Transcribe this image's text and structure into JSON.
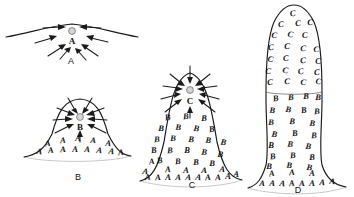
{
  "figure": {
    "background_color": "#ffffff",
    "ink_color": "#1a1a1a",
    "core_dot_color": "#d6d6d6"
  },
  "panels": [
    {
      "id": "A",
      "label": "A",
      "label_x": 71,
      "label_y": 62,
      "description": "Nearly flat surface with a small nucleating core",
      "core": {
        "letter": "A",
        "x": 72,
        "y": 41,
        "dot_x": 72,
        "dot_y": 31
      },
      "zones": [],
      "arrow_count": 8
    },
    {
      "id": "B",
      "label": "B",
      "label_x": 78,
      "label_y": 178,
      "description": "Low mound; base populated by A, core growing as B",
      "core": {
        "letter": "B",
        "x": 80,
        "y": 126,
        "dot_x": 80,
        "dot_y": 117
      },
      "zones": [
        {
          "letter": "A",
          "rows": 2
        }
      ],
      "arrow_count": 8
    },
    {
      "id": "C",
      "label": "C",
      "label_x": 192,
      "label_y": 186,
      "description": "Tall mound; A at base, B mantle, core growing as C",
      "core": {
        "letter": "C",
        "x": 190,
        "y": 101,
        "dot_x": 190,
        "dot_y": 90
      },
      "zones": [
        {
          "letter": "A",
          "rows": 2
        },
        {
          "letter": "B",
          "rows": 5
        }
      ],
      "arrow_count": 9
    },
    {
      "id": "D",
      "label": "D",
      "label_x": 298,
      "label_y": 191,
      "description": "Mature column; A base, B shaft, C cap zone fully formed",
      "core": null,
      "zones": [
        {
          "letter": "A",
          "rows": 2
        },
        {
          "letter": "B",
          "rows": 8
        },
        {
          "letter": "C",
          "rows": 8
        }
      ],
      "arrow_count": 0
    }
  ],
  "letters": {
    "panelB_A": [
      {
        "x": 48,
        "y": 146
      },
      {
        "x": 63,
        "y": 143
      },
      {
        "x": 78,
        "y": 141
      },
      {
        "x": 93,
        "y": 143
      },
      {
        "x": 108,
        "y": 146
      },
      {
        "x": 39,
        "y": 154
      },
      {
        "x": 51,
        "y": 153
      },
      {
        "x": 63,
        "y": 152
      },
      {
        "x": 75,
        "y": 152
      },
      {
        "x": 87,
        "y": 152
      },
      {
        "x": 99,
        "y": 153
      },
      {
        "x": 111,
        "y": 154
      },
      {
        "x": 121,
        "y": 155
      }
    ],
    "panelC_B": [
      {
        "x": 168,
        "y": 120
      },
      {
        "x": 186,
        "y": 119
      },
      {
        "x": 204,
        "y": 121
      },
      {
        "x": 161,
        "y": 131
      },
      {
        "x": 178,
        "y": 130
      },
      {
        "x": 196,
        "y": 131
      },
      {
        "x": 212,
        "y": 132
      },
      {
        "x": 157,
        "y": 142
      },
      {
        "x": 173,
        "y": 141
      },
      {
        "x": 191,
        "y": 142
      },
      {
        "x": 208,
        "y": 143
      },
      {
        "x": 223,
        "y": 145
      },
      {
        "x": 154,
        "y": 153
      },
      {
        "x": 170,
        "y": 153
      },
      {
        "x": 187,
        "y": 153
      },
      {
        "x": 204,
        "y": 155
      },
      {
        "x": 220,
        "y": 157
      },
      {
        "x": 160,
        "y": 163
      },
      {
        "x": 178,
        "y": 164
      },
      {
        "x": 196,
        "y": 165
      },
      {
        "x": 212,
        "y": 166
      }
    ],
    "panelC_A": [
      {
        "x": 152,
        "y": 164
      },
      {
        "x": 168,
        "y": 172
      },
      {
        "x": 186,
        "y": 173
      },
      {
        "x": 204,
        "y": 173
      },
      {
        "x": 222,
        "y": 172
      },
      {
        "x": 145,
        "y": 174
      },
      {
        "x": 148,
        "y": 180
      },
      {
        "x": 158,
        "y": 180
      },
      {
        "x": 168,
        "y": 180
      },
      {
        "x": 178,
        "y": 180
      },
      {
        "x": 188,
        "y": 180
      },
      {
        "x": 198,
        "y": 180
      },
      {
        "x": 208,
        "y": 180
      },
      {
        "x": 218,
        "y": 180
      },
      {
        "x": 228,
        "y": 179
      },
      {
        "x": 236,
        "y": 177
      }
    ],
    "panelD_C": [
      {
        "x": 293,
        "y": 16
      },
      {
        "x": 281,
        "y": 27
      },
      {
        "x": 298,
        "y": 26
      },
      {
        "x": 310,
        "y": 25
      },
      {
        "x": 274,
        "y": 38
      },
      {
        "x": 290,
        "y": 37
      },
      {
        "x": 305,
        "y": 38
      },
      {
        "x": 271,
        "y": 50
      },
      {
        "x": 287,
        "y": 49
      },
      {
        "x": 303,
        "y": 51
      },
      {
        "x": 316,
        "y": 52
      },
      {
        "x": 270,
        "y": 62
      },
      {
        "x": 286,
        "y": 61
      },
      {
        "x": 303,
        "y": 63
      },
      {
        "x": 318,
        "y": 64
      },
      {
        "x": 268,
        "y": 74
      },
      {
        "x": 285,
        "y": 73
      },
      {
        "x": 301,
        "y": 74
      },
      {
        "x": 317,
        "y": 75
      },
      {
        "x": 270,
        "y": 85
      },
      {
        "x": 287,
        "y": 84
      },
      {
        "x": 303,
        "y": 85
      },
      {
        "x": 318,
        "y": 84
      }
    ],
    "panelD_B": [
      {
        "x": 276,
        "y": 101
      },
      {
        "x": 291,
        "y": 100
      },
      {
        "x": 306,
        "y": 99
      },
      {
        "x": 318,
        "y": 100
      },
      {
        "x": 272,
        "y": 113
      },
      {
        "x": 288,
        "y": 112
      },
      {
        "x": 304,
        "y": 113
      },
      {
        "x": 317,
        "y": 114
      },
      {
        "x": 271,
        "y": 125
      },
      {
        "x": 292,
        "y": 124
      },
      {
        "x": 312,
        "y": 126
      },
      {
        "x": 274,
        "y": 137
      },
      {
        "x": 295,
        "y": 136
      },
      {
        "x": 314,
        "y": 138
      },
      {
        "x": 271,
        "y": 148
      },
      {
        "x": 290,
        "y": 147
      },
      {
        "x": 308,
        "y": 149
      },
      {
        "x": 273,
        "y": 159
      },
      {
        "x": 293,
        "y": 158
      },
      {
        "x": 312,
        "y": 160
      },
      {
        "x": 269,
        "y": 169
      },
      {
        "x": 289,
        "y": 168
      },
      {
        "x": 309,
        "y": 170
      }
    ],
    "panelD_A": [
      {
        "x": 272,
        "y": 176
      },
      {
        "x": 292,
        "y": 175
      },
      {
        "x": 312,
        "y": 176
      },
      {
        "x": 262,
        "y": 186
      },
      {
        "x": 272,
        "y": 186
      },
      {
        "x": 282,
        "y": 186
      },
      {
        "x": 292,
        "y": 186
      },
      {
        "x": 302,
        "y": 186
      },
      {
        "x": 312,
        "y": 186
      },
      {
        "x": 322,
        "y": 185
      },
      {
        "x": 332,
        "y": 184
      }
    ]
  }
}
